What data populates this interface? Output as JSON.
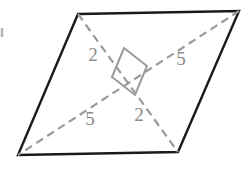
{
  "figure": {
    "name": "parallelogram-with-perpendicular-diagonals",
    "canvas": {
      "width": 248,
      "height": 174
    },
    "background_color": "#ffffff",
    "outline_color": "#1a1a1a",
    "outline_width": 2.4,
    "diagonal_color": "#9a9a9a",
    "diagonal_width": 2.2,
    "diagonal_dash": "8 5",
    "label_color": "#8a8a8a",
    "vertices": {
      "top_left": {
        "x": 78,
        "y": 14
      },
      "top_right": {
        "x": 239,
        "y": 11
      },
      "bottom_right": {
        "x": 178,
        "y": 152
      },
      "bottom_left": {
        "x": 18,
        "y": 155
      }
    },
    "outline_path": "M 78 14 L 239 11 L 178 152 L 18 155 Z",
    "diagonals": [
      {
        "name": "diagonal-tl-br",
        "from": "top_left",
        "to": "bottom_right",
        "path": "M 78 14 L 178 152"
      },
      {
        "name": "diagonal-tr-bl",
        "from": "top_right",
        "to": "bottom_left",
        "path": "M 239 11 L 18 155"
      }
    ],
    "intersection": {
      "x": 128,
      "y": 83
    },
    "right_angle_marker": {
      "name": "right-angle-square",
      "path": "M 112 77 L 124 48 L 147 66 L 135 95 Z",
      "stroke": "#9a9a9a",
      "stroke_width": 2.0
    },
    "edge_tick": {
      "name": "left-edge-tick",
      "path": "M 2 28 L 2 37",
      "stroke": "#b5b5b5",
      "stroke_width": 2.5
    },
    "labels": [
      {
        "id": "label-2-upper",
        "text": "2",
        "x": 93,
        "y": 57,
        "segment": "upper-left half of diagonal TL-BR"
      },
      {
        "id": "label-5-right",
        "text": "5",
        "x": 181,
        "y": 61,
        "segment": "upper-right half of diagonal TR-BL"
      },
      {
        "id": "label-5-lower",
        "text": "5",
        "x": 90,
        "y": 121,
        "segment": "lower-left half of diagonal TR-BL"
      },
      {
        "id": "label-2-lower",
        "text": "2",
        "x": 139,
        "y": 117,
        "segment": "lower-right half of diagonal TL-BR"
      }
    ]
  }
}
